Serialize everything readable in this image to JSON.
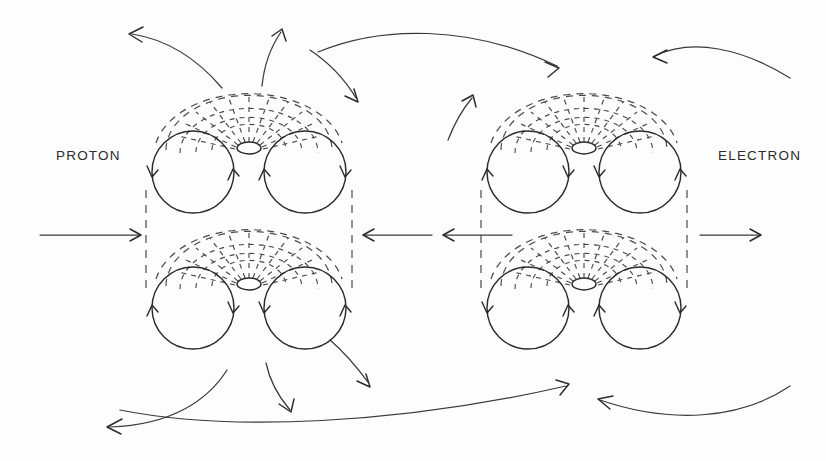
{
  "figure": {
    "background_color": "#fdfdfd",
    "stroke_color": "#2b2b2b",
    "dash_color": "#4a4a4a",
    "width": 826,
    "height": 461
  },
  "labels": {
    "left": "PROTON",
    "right": "ELECTRON"
  },
  "clusters": [
    {
      "id": "proton-upper",
      "side": "left",
      "row": "upper",
      "center": [
        249,
        172
      ],
      "circles": [
        {
          "name": "left-circle",
          "cx": 193,
          "cy": 172,
          "r": 41,
          "spin": "clockwise"
        },
        {
          "name": "right-circle",
          "cx": 305,
          "cy": 172,
          "r": 41,
          "spin": "counter-clockwise"
        }
      ],
      "core_ellipse": {
        "cx": 249,
        "cy": 148,
        "rx": 12,
        "ry": 6
      },
      "fan_direction": "up"
    },
    {
      "id": "proton-lower",
      "side": "left",
      "row": "lower",
      "center": [
        249,
        308
      ],
      "circles": [
        {
          "name": "left-circle",
          "cx": 193,
          "cy": 308,
          "r": 41,
          "spin": "counter-clockwise"
        },
        {
          "name": "right-circle",
          "cx": 305,
          "cy": 308,
          "r": 41,
          "spin": "clockwise"
        }
      ],
      "core_ellipse": {
        "cx": 249,
        "cy": 284,
        "rx": 12,
        "ry": 6
      },
      "fan_direction": "up"
    },
    {
      "id": "electron-upper",
      "side": "right",
      "row": "upper",
      "center": [
        584,
        172
      ],
      "circles": [
        {
          "name": "left-circle",
          "cx": 528,
          "cy": 172,
          "r": 41,
          "spin": "counter-clockwise"
        },
        {
          "name": "right-circle",
          "cx": 640,
          "cy": 172,
          "r": 41,
          "spin": "clockwise"
        }
      ],
      "core_ellipse": {
        "cx": 584,
        "cy": 148,
        "rx": 12,
        "ry": 6
      },
      "fan_direction": "up"
    },
    {
      "id": "electron-lower",
      "side": "right",
      "row": "lower",
      "center": [
        584,
        308
      ],
      "circles": [
        {
          "name": "left-circle",
          "cx": 528,
          "cy": 308,
          "r": 41,
          "spin": "clockwise"
        },
        {
          "name": "right-circle",
          "cx": 640,
          "cy": 308,
          "r": 41,
          "spin": "counter-clockwise"
        }
      ],
      "core_ellipse": {
        "cx": 584,
        "cy": 284,
        "rx": 12,
        "ry": 6
      },
      "fan_direction": "up"
    }
  ],
  "straight_arrows": [
    {
      "name": "far-left-inflow",
      "from": [
        40,
        235
      ],
      "to": [
        140,
        235
      ],
      "direction": "right"
    },
    {
      "name": "center-left-arrow",
      "from": [
        432,
        235
      ],
      "to": [
        362,
        235
      ],
      "direction": "left"
    },
    {
      "name": "center-right-arrow",
      "from": [
        512,
        235
      ],
      "to": [
        442,
        235
      ],
      "direction": "left"
    },
    {
      "name": "far-right-outflow",
      "from": [
        700,
        235
      ],
      "to": [
        760,
        235
      ],
      "direction": "right"
    }
  ],
  "curved_arrows": [
    {
      "name": "top-left-outward",
      "direction": "left",
      "region": "top-left"
    },
    {
      "name": "top-center-up",
      "direction": "up",
      "region": "top-center-left"
    },
    {
      "name": "top-left-down-right",
      "direction": "down-right",
      "region": "top-mid-left"
    },
    {
      "name": "top-long-sweep-right",
      "direction": "right",
      "region": "top-center"
    },
    {
      "name": "top-right-inward",
      "direction": "left",
      "region": "top-right"
    },
    {
      "name": "mid-right-up",
      "direction": "up",
      "region": "upper-right-cluster-left"
    },
    {
      "name": "bottom-left-outward",
      "direction": "left",
      "region": "bottom-left"
    },
    {
      "name": "bottom-center-down",
      "direction": "down",
      "region": "bottom-center-left"
    },
    {
      "name": "bottom-left-down-right",
      "direction": "down-right",
      "region": "bottom-mid-left"
    },
    {
      "name": "bottom-long-sweep-right",
      "direction": "right",
      "region": "bottom-center"
    },
    {
      "name": "bottom-right-inward",
      "direction": "left",
      "region": "bottom-right"
    }
  ],
  "dashed_verticals": [
    {
      "name": "proton-left-edge",
      "x": 146,
      "y1": 190,
      "y2": 290
    },
    {
      "name": "proton-right-edge",
      "x": 352,
      "y1": 190,
      "y2": 290
    },
    {
      "name": "electron-left-edge",
      "x": 481,
      "y1": 190,
      "y2": 290
    },
    {
      "name": "electron-right-edge",
      "x": 687,
      "y1": 190,
      "y2": 290
    }
  ]
}
